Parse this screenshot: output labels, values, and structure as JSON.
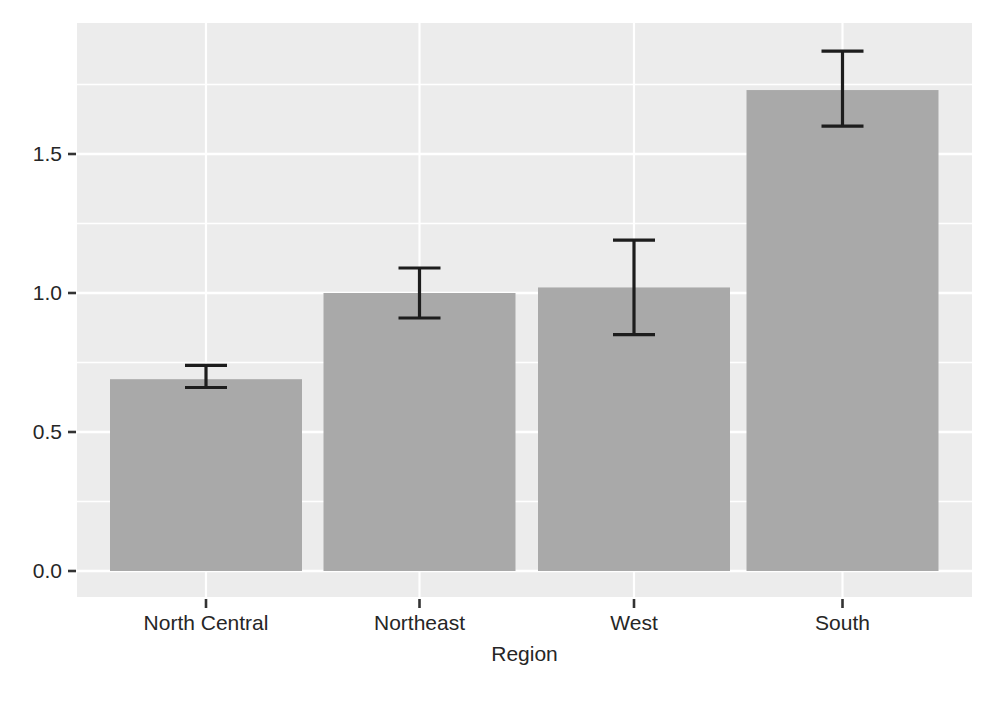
{
  "chart_data": {
    "type": "bar",
    "title": "",
    "xlabel": "Region",
    "ylabel": "",
    "categories": [
      "North Central",
      "Northeast",
      "West",
      "South"
    ],
    "values": [
      0.69,
      1.0,
      1.02,
      1.73
    ],
    "error_low": [
      0.66,
      0.91,
      0.85,
      1.6
    ],
    "error_high": [
      0.74,
      1.09,
      1.19,
      1.87
    ],
    "ylim": [
      0,
      1.97
    ],
    "yticks": [
      0,
      0.5,
      1.0,
      1.5
    ],
    "ytick_labels": [
      "0.0",
      "0.5",
      "1.0",
      "1.5"
    ],
    "yminor": [
      0.25,
      0.75,
      1.25,
      1.75
    ],
    "grid": "white major+minor horizontal lines and vertical lines at category centers on gray panel",
    "legend": "none",
    "colors": {
      "page_background": "#ffffff",
      "panel_background": "#ececec",
      "gridline": "#ffffff",
      "bar_fill": "#a9a9a9",
      "error_bar": "#1d1d1d",
      "tick_mark": "#333333",
      "tick_text": "#262626",
      "axis_title_text": "#262626"
    }
  }
}
